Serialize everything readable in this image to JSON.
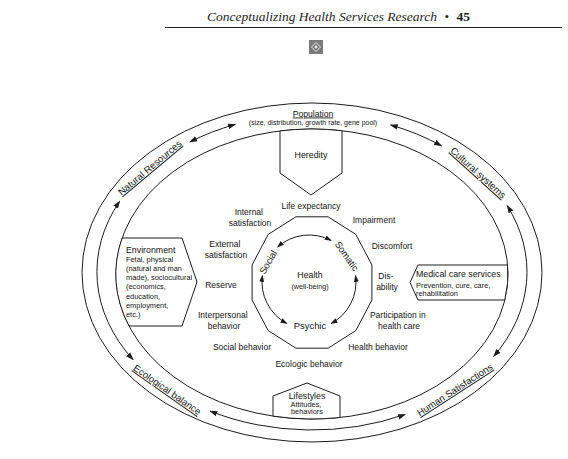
{
  "header": {
    "title": "Conceptualizing Health Services Research",
    "separator": "•",
    "page_number": "45",
    "ornament_icon": "ornament-icon"
  },
  "diagram": {
    "ring": {
      "population": {
        "title": "Population",
        "subtitle": "(size, distribution, growth rate, gene pool)"
      },
      "labels": {
        "natural_resources": "Natural Resources",
        "cultural_systems": "Cultural systems",
        "ecological_balance": "Ecological balance",
        "human_satisfactions": "Human Satisfactions"
      },
      "connections": [
        {
          "from": "Natural Resources",
          "to": "Population",
          "type": "bidirectional"
        },
        {
          "from": "Population",
          "to": "Cultural systems",
          "type": "bidirectional"
        },
        {
          "from": "Cultural systems",
          "to": "Human Satisfactions",
          "type": "bidirectional"
        },
        {
          "from": "Human Satisfactions",
          "to": "Ecological balance",
          "type": "bidirectional"
        },
        {
          "from": "Ecological balance",
          "to": "Natural Resources",
          "type": "bidirectional"
        }
      ]
    },
    "inputs": {
      "heredity": {
        "title": "Heredity"
      },
      "environment": {
        "title": "Environment",
        "lines": [
          "Fetal, physical",
          "(natural and man",
          "made), sociocultural",
          "(economics,",
          "education,",
          "employment,",
          "etc.)"
        ]
      },
      "medical_care": {
        "title": "Medical care services",
        "lines": [
          "Prevention, cure, care,",
          "rehabilitation"
        ]
      },
      "lifestyles": {
        "title": "Lifestyles",
        "lines": [
          "Attitudes,",
          "behaviors"
        ]
      }
    },
    "outcomes": [
      {
        "lines": [
          "Life expectancy"
        ]
      },
      {
        "lines": [
          "Impairment"
        ]
      },
      {
        "lines": [
          "Discomfort"
        ]
      },
      {
        "lines": [
          "Dis-",
          "ability"
        ]
      },
      {
        "lines": [
          "Participation in",
          "health care"
        ]
      },
      {
        "lines": [
          "Health behavior"
        ]
      },
      {
        "lines": [
          "Ecologic behavior"
        ]
      },
      {
        "lines": [
          "Social behavior"
        ]
      },
      {
        "lines": [
          "Interpersonal",
          "behavior"
        ]
      },
      {
        "lines": [
          "Reserve"
        ]
      },
      {
        "lines": [
          "External",
          "satisfaction"
        ]
      },
      {
        "lines": [
          "Internal",
          "satisfaction"
        ]
      }
    ],
    "core": {
      "title": "Health",
      "subtitle": "(well-being)",
      "dimensions": {
        "social": "Social",
        "somatic": "Somatic",
        "psychic": "Psychic"
      },
      "connections": [
        {
          "from": "Social",
          "to": "Somatic",
          "type": "bidirectional"
        },
        {
          "from": "Somatic",
          "to": "Psychic",
          "type": "bidirectional"
        },
        {
          "from": "Psychic",
          "to": "Social",
          "type": "bidirectional"
        }
      ]
    }
  }
}
